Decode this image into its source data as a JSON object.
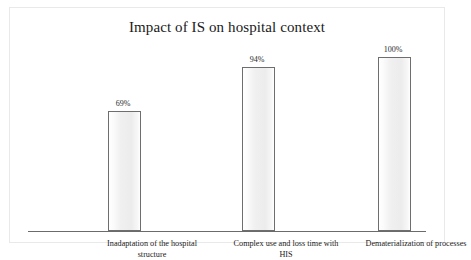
{
  "chart_data": {
    "type": "bar",
    "title": "Impact of IS on hospital context",
    "xlabel": "",
    "ylabel": "",
    "ylim": [
      0,
      100
    ],
    "grid": false,
    "legend": "none",
    "value_suffix": "%",
    "categories": [
      "Inadaptation of the hospital structure",
      "Complex use and loss time with HIS",
      "Dematerialization of processes"
    ],
    "category_lines": [
      [
        "Inadaptation of the hospital",
        "structure"
      ],
      [
        "Complex use and loss time with",
        "HIS"
      ],
      [
        "Dematerialization of processes",
        ""
      ]
    ],
    "values": [
      69,
      94,
      100
    ],
    "value_labels": [
      "69%",
      "94%",
      "100%"
    ],
    "colors": {
      "bar_fill": "#f0f0f0",
      "bar_border": "#6e6e6e",
      "axis": "#6b6b6b",
      "frame": "#e9e9e9",
      "text": "#1a1a1a",
      "background": "#ffffff"
    }
  }
}
